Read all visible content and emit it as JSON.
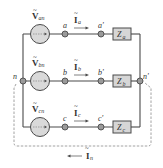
{
  "colors": {
    "wire": "#4a4a4a",
    "node_fill": "#9a9a9a",
    "source_fill": "#d9d9d9",
    "box_fill": "#d6d6d6",
    "dashed": "#8c8c8c",
    "text": "#333333"
  },
  "nodes": {
    "n": "n",
    "n_prime": "n'",
    "a": "a",
    "a_prime": "a'",
    "b": "b",
    "b_prime": "b'",
    "c": "c",
    "c_prime": "c'"
  },
  "sources": [
    {
      "main": "V",
      "sub": "an"
    },
    {
      "main": "V",
      "sub": "bn"
    },
    {
      "main": "V",
      "sub": "cn"
    }
  ],
  "currents": [
    {
      "main": "I",
      "sub": "a"
    },
    {
      "main": "I",
      "sub": "b"
    },
    {
      "main": "I",
      "sub": "c"
    },
    {
      "main": "I",
      "sub": "n"
    }
  ],
  "impedances": [
    {
      "main": "Z",
      "sub": "a"
    },
    {
      "main": "Z",
      "sub": "b"
    },
    {
      "main": "Z",
      "sub": "c"
    }
  ],
  "tilde": "~"
}
